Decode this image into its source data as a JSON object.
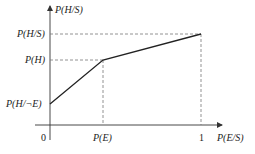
{
  "diagram": {
    "type": "piecewise-linear-graph",
    "y_axis_label": "P(H/S)",
    "x_axis_label": "P(E/S)",
    "y_ticks": [
      {
        "label": "P(H/S)",
        "y": 34
      },
      {
        "label": "P(H)",
        "y": 60
      },
      {
        "label": "P(H/¬E)",
        "y": 104
      }
    ],
    "x_ticks": [
      {
        "label": "0",
        "x": 50
      },
      {
        "label": "P(E)",
        "x": 103
      },
      {
        "label": "1",
        "x": 201
      }
    ],
    "points": [
      {
        "name": "P(E/S)=0",
        "x": 0,
        "y": "P(H/¬E)"
      },
      {
        "name": "P(E/S)=P(E)",
        "x": "P(E)",
        "y": "P(H)"
      },
      {
        "name": "P(E/S)=1",
        "x": 1,
        "y": "P(H/S)"
      }
    ],
    "colors": {
      "line": "#222222",
      "dashed": "#777777",
      "axis": "#333333"
    }
  },
  "labels": {
    "y_axis": "P(H/S)",
    "x_axis": "P(E/S)",
    "y_tick_top": "P(H/S)",
    "y_tick_mid": "P(H)",
    "y_tick_low": "P(H/¬E)",
    "x_tick_zero": "0",
    "x_tick_pe": "P(E)",
    "x_tick_one": "1"
  }
}
